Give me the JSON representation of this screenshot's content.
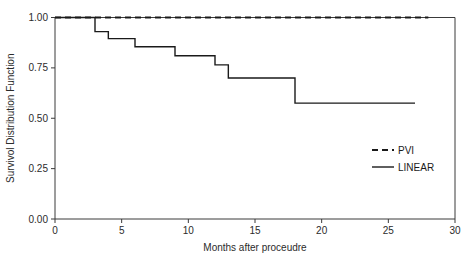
{
  "chart_data": {
    "type": "line",
    "title": "",
    "subtitle": "",
    "xlabel": "Months after proceudre",
    "ylabel": "Survivol Distribution Function",
    "xlim": [
      0,
      30
    ],
    "ylim": [
      0,
      1.0
    ],
    "xticks": [
      0,
      5,
      10,
      15,
      20,
      25,
      30
    ],
    "xtick_labels": [
      "0",
      "5",
      "10",
      "15",
      "20",
      "25",
      "30"
    ],
    "yticks": [
      0.0,
      0.25,
      0.5,
      0.75,
      1.0
    ],
    "ytick_labels": [
      "0.00",
      "0.25",
      "0.50",
      "0.75",
      "1.00"
    ],
    "grid": false,
    "legend_position": "center-right",
    "series": [
      {
        "name": "PVI",
        "style": "dashed",
        "color": "#1a1a1a",
        "x": [
          0,
          28
        ],
        "y": [
          1.0,
          1.0
        ],
        "steps": [
          {
            "month": 0,
            "survival": 1.0
          },
          {
            "month": 28,
            "survival": 1.0
          }
        ]
      },
      {
        "name": "LINEAR",
        "style": "solid",
        "color": "#1a1a1a",
        "x": [
          0,
          3,
          4,
          6,
          9,
          12,
          13,
          18,
          27
        ],
        "y": [
          1.0,
          0.93,
          0.895,
          0.855,
          0.81,
          0.765,
          0.7,
          0.575,
          0.575
        ],
        "steps": [
          {
            "month": 0,
            "survival": 1.0
          },
          {
            "month": 3,
            "survival": 0.93
          },
          {
            "month": 4,
            "survival": 0.895
          },
          {
            "month": 6,
            "survival": 0.855
          },
          {
            "month": 9,
            "survival": 0.81
          },
          {
            "month": 12,
            "survival": 0.765
          },
          {
            "month": 13,
            "survival": 0.7
          },
          {
            "month": 18,
            "survival": 0.575
          },
          {
            "month": 27,
            "survival": 0.575
          }
        ]
      }
    ]
  },
  "legend": {
    "entries": [
      {
        "label": "PVI",
        "style": "dashed"
      },
      {
        "label": "LINEAR",
        "style": "solid"
      }
    ]
  },
  "axes": {
    "x_title": "Months after proceudre",
    "y_title": "Survivol Distribution Function"
  }
}
